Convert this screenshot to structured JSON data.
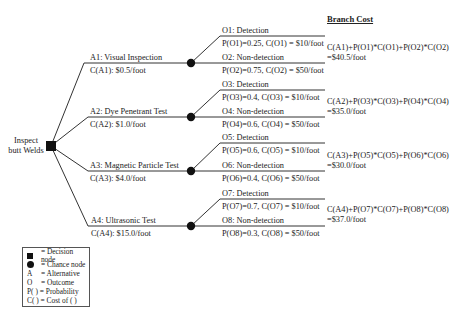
{
  "root": {
    "label_line1": "Inspect",
    "label_line2": "butt Welds",
    "type": "decision"
  },
  "header": {
    "branch_cost": "Branch Cost"
  },
  "alternatives": [
    {
      "name": "A1: Visual Inspection",
      "cost": "C(A1): $0.5/foot",
      "outcomes": [
        {
          "name": "O1: Detection",
          "prob_cost": "P(O1)=0.25, C(O1) = $10/foot"
        },
        {
          "name": "O2: Non-detection",
          "prob_cost": "P(O2)=0.75, C(O2) = $50/foot"
        }
      ],
      "branch_formula": "C(A1)+P(O1)*C(O1)+P(O2)*C(O2)",
      "branch_value": "=$40.5/foot"
    },
    {
      "name": "A2: Dye Penetrant Test",
      "cost": "C(A2): $1.0/foot",
      "outcomes": [
        {
          "name": "O3: Detection",
          "prob_cost": "P(O3)=0.4, C(O3) = $10/foot"
        },
        {
          "name": "O4: Non-detection",
          "prob_cost": "P(O4)=0.6, C(O4) = $50/foot"
        }
      ],
      "branch_formula": "C(A2)+P(O3)*C(O3)+P(O4)*C(O4)",
      "branch_value": "=$35.0/foot"
    },
    {
      "name": "A3: Magnetic Particle Test",
      "cost": "C(A3): $4.0/foot",
      "outcomes": [
        {
          "name": "O5: Detection",
          "prob_cost": "P(O5)=0.6, C(O5) = $10/foot"
        },
        {
          "name": "O6: Non-detection",
          "prob_cost": "P(O6)=0.4, C(O6) = $50/foot"
        }
      ],
      "branch_formula": "C(A3)+P(O5)*C(O5)+P(O6)*C(O6)",
      "branch_value": "=$30.0/foot"
    },
    {
      "name": "A4: Ultrasonic Test",
      "cost": "C(A4): $15.0/foot",
      "outcomes": [
        {
          "name": "O7: Detection",
          "prob_cost": "P(O7)=0.7, C(O7) = $10/foot"
        },
        {
          "name": "O8: Non-detection",
          "prob_cost": "P(O8)=0.3, C(O8) = $50/foot"
        }
      ],
      "branch_formula": "C(A4)+P(O7)*C(O7)+P(O8)*C(O8)",
      "branch_value": "=$37.0/foot"
    }
  ],
  "legend": [
    {
      "symbol": "square",
      "text": "= Decision node"
    },
    {
      "symbol": "circle",
      "text": "= Chance node"
    },
    {
      "symbol": "A",
      "text": "= Alternative"
    },
    {
      "symbol": "O",
      "text": "= Outcome"
    },
    {
      "symbol": "P( )",
      "text": "= Probability"
    },
    {
      "symbol": "C( )",
      "text": "= Cost of ( )"
    }
  ],
  "colors": {
    "line": "#333333",
    "node": "#111111",
    "text": "#222222"
  }
}
